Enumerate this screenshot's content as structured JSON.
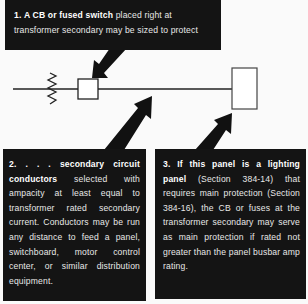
{
  "callouts": [
    {
      "number": "1.",
      "bold": "A CB or fused switch",
      "text": " placed right at transformer secondary may be sized to protect"
    },
    {
      "number": "2. . . .",
      "bold": "secondary circuit conductors",
      "text": " selected with ampacity at least equal to transformer rated secondary current. Conductors may be run any distance to feed a panel, switchboard, motor control center, or similar distribution equipment."
    },
    {
      "number": "3.",
      "bold": "If this panel is a lighting panel",
      "text": " (Section 384-14) that requires main protection (Section 384-16), the CB or fuses at the transformer secondary may serve as main protection if rated not greater than the panel busbar amp rating."
    }
  ],
  "diagram": {
    "elements": [
      "transformer-secondary-winding",
      "circuit-breaker-box",
      "secondary-conductor-line",
      "panel-box"
    ],
    "colors": {
      "callout_bg": "#141414",
      "callout_text": "#e8e8e8",
      "line": "#222222",
      "background": "#fafafa"
    }
  }
}
